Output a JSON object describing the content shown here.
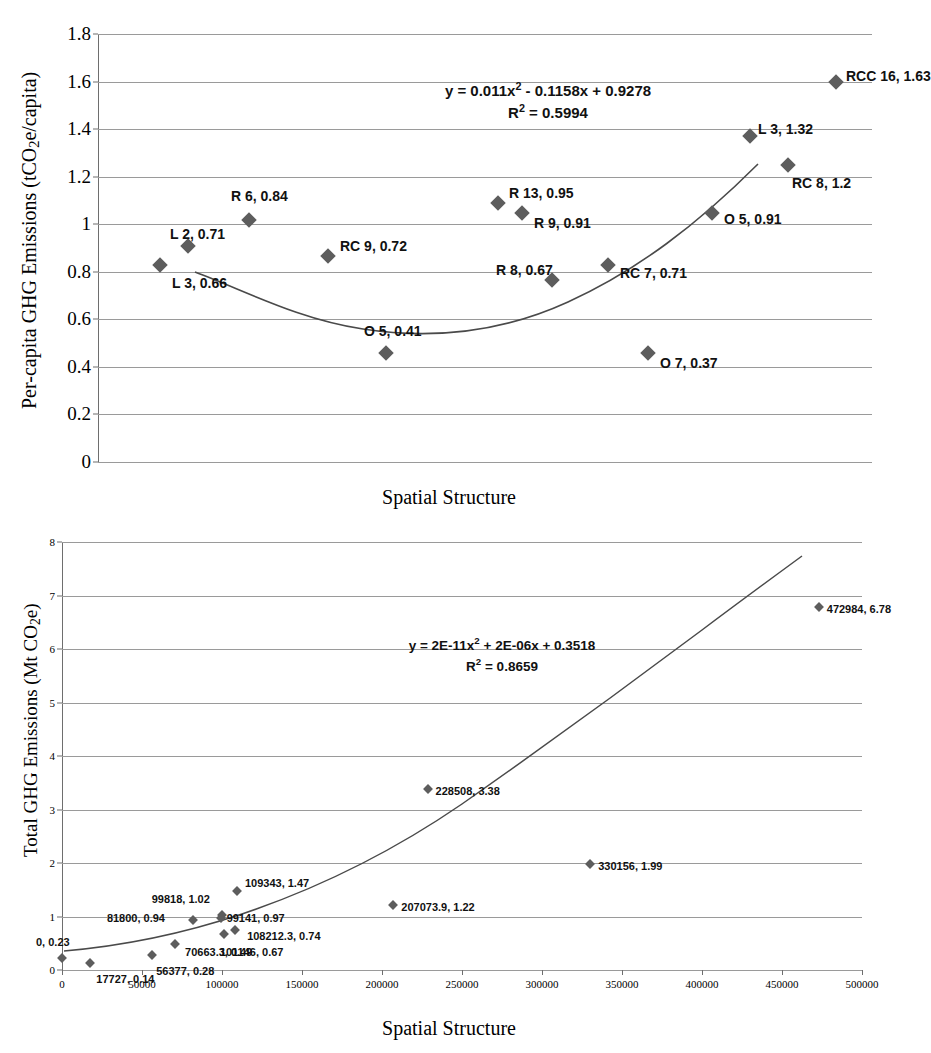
{
  "charts": [
    {
      "id": "per-capita",
      "ylabel_pre": "Per-capita GHG Emissions (tCO",
      "ylabel_sub": "2",
      "ylabel_post": "e/capita)",
      "xlabel": "Spatial Structure",
      "equation": "y = 0.011x² - 0.1158x + 0.9278",
      "equation_main": "y = 0.011x",
      "equation_sup": "2",
      "equation_rest": " - 0.1158x + 0.9278",
      "r2_main": "R",
      "r2_sup": "2",
      "r2_rest": " = 0.5994",
      "yticks": [
        "1.8",
        "1.6",
        "1.4",
        "1.2",
        "1",
        "0.8",
        "0.6",
        "0.4",
        "0.2",
        "0"
      ],
      "labels": [
        "L 3, 0.66",
        "L 2, 0.71",
        "R 6, 0.84",
        "RC 9, 0.72",
        "O 5, 0.41",
        "R 13, 0.95",
        "R 9, 0.91",
        "R 8, 0.67",
        "RC 7, 0.71",
        "O 7, 0.37",
        "O 5, 0.91",
        "L 3, 1.32",
        "RC 8, 1.2",
        "RCC 16, 1.63"
      ]
    },
    {
      "id": "total",
      "ylabel_pre": "Total GHG Emissions (Mt CO",
      "ylabel_sub": "2",
      "ylabel_post": "e)",
      "xlabel": "Spatial Structure",
      "equation_main": "y = 2E-11x",
      "equation_sup": "2",
      "equation_rest": " + 2E-06x + 0.3518",
      "r2_main": "R",
      "r2_sup": "2",
      "r2_rest": " = 0.8659",
      "yticks": [
        "8",
        "7",
        "6",
        "5",
        "4",
        "3",
        "2",
        "1",
        "0"
      ],
      "xticks": [
        "0",
        "50000",
        "100000",
        "150000",
        "200000",
        "250000",
        "300000",
        "350000",
        "400000",
        "450000",
        "500000"
      ],
      "labels": [
        "0, 0.23",
        "17727, 0.14",
        "56377, 0.28",
        "70663.3, 0.49",
        "81800, 0.94",
        "99818, 1.02",
        "99141, 0.97",
        "101146, 0.67",
        "108212.3, 0.74",
        "109343, 1.47",
        "207073.9, 1.22",
        "228508, 3.38",
        "330156, 1.99",
        "472984, 6.78"
      ]
    }
  ],
  "chart_data": [
    {
      "type": "scatter",
      "title": "",
      "xlabel": "Spatial Structure",
      "ylabel": "Per-capita GHG Emissions (tCO2e/capita)",
      "ylim": [
        0,
        1.8
      ],
      "ytick_values": [
        0,
        0.2,
        0.4,
        0.6,
        0.8,
        1.0,
        1.2,
        1.4,
        1.6,
        1.8
      ],
      "grid": true,
      "legend": "none",
      "trendline": {
        "type": "polynomial",
        "order": 2,
        "equation": "y = 0.011x^2 - 0.1158x + 0.9278",
        "r_squared": 0.5994,
        "coefficients": [
          0.011,
          -0.1158,
          0.9278
        ]
      },
      "points": [
        {
          "label": "L 3, 0.66",
          "category": "L 3",
          "x": 3,
          "y": 0.66
        },
        {
          "label": "L 2, 0.71",
          "category": "L 2",
          "x": 2,
          "y": 0.71
        },
        {
          "label": "R 6, 0.84",
          "category": "R 6",
          "x": 6,
          "y": 0.84
        },
        {
          "label": "RC 9, 0.72",
          "category": "RC 9",
          "x": 9,
          "y": 0.72
        },
        {
          "label": "O 5, 0.41",
          "category": "O 5",
          "x": 5,
          "y": 0.41
        },
        {
          "label": "R 13, 0.95",
          "category": "R 13",
          "x": 13,
          "y": 0.95
        },
        {
          "label": "R 9, 0.91",
          "category": "R 9",
          "x": 9,
          "y": 0.91
        },
        {
          "label": "R 8, 0.67",
          "category": "R 8",
          "x": 8,
          "y": 0.67
        },
        {
          "label": "RC 7, 0.71",
          "category": "RC 7",
          "x": 7,
          "y": 0.71
        },
        {
          "label": "O 7, 0.37",
          "category": "O 7",
          "x": 7,
          "y": 0.37
        },
        {
          "label": "O 5, 0.91",
          "category": "O 5",
          "x": 5,
          "y": 0.91
        },
        {
          "label": "L 3, 1.32",
          "category": "L 3",
          "x": 3,
          "y": 1.32
        },
        {
          "label": "RC 8, 1.2",
          "category": "RC 8",
          "x": 8,
          "y": 1.2
        },
        {
          "label": "RCC 16, 1.63",
          "category": "RCC 16",
          "x": 16,
          "y": 1.63
        }
      ]
    },
    {
      "type": "scatter",
      "title": "",
      "xlabel": "Spatial Structure",
      "ylabel": "Total GHG Emissions (Mt CO2e)",
      "xlim": [
        0,
        500000
      ],
      "ylim": [
        0,
        8
      ],
      "xtick_values": [
        0,
        50000,
        100000,
        150000,
        200000,
        250000,
        300000,
        350000,
        400000,
        450000,
        500000
      ],
      "ytick_values": [
        0,
        1,
        2,
        3,
        4,
        5,
        6,
        7,
        8
      ],
      "grid": true,
      "legend": "none",
      "trendline": {
        "type": "polynomial",
        "order": 2,
        "equation": "y = 2E-11x^2 + 2E-06x + 0.3518",
        "r_squared": 0.8659,
        "coefficients": [
          2e-11,
          2e-06,
          0.3518
        ]
      },
      "points": [
        {
          "label": "0, 0.23",
          "x": 0,
          "y": 0.23
        },
        {
          "label": "17727, 0.14",
          "x": 17727,
          "y": 0.14
        },
        {
          "label": "56377, 0.28",
          "x": 56377,
          "y": 0.28
        },
        {
          "label": "70663.3, 0.49",
          "x": 70663.3,
          "y": 0.49
        },
        {
          "label": "81800, 0.94",
          "x": 81800,
          "y": 0.94
        },
        {
          "label": "99818, 1.02",
          "x": 99818,
          "y": 1.02
        },
        {
          "label": "99141, 0.97",
          "x": 99141,
          "y": 0.97
        },
        {
          "label": "101146, 0.67",
          "x": 101146,
          "y": 0.67
        },
        {
          "label": "108212.3, 0.74",
          "x": 108212.3,
          "y": 0.74
        },
        {
          "label": "109343, 1.47",
          "x": 109343,
          "y": 1.47
        },
        {
          "label": "207073.9, 1.22",
          "x": 207073.9,
          "y": 1.22
        },
        {
          "label": "228508, 3.38",
          "x": 228508,
          "y": 3.38
        },
        {
          "label": "330156, 1.99",
          "x": 330156,
          "y": 1.99
        },
        {
          "label": "472984, 6.78",
          "x": 472984,
          "y": 6.78
        }
      ]
    }
  ]
}
